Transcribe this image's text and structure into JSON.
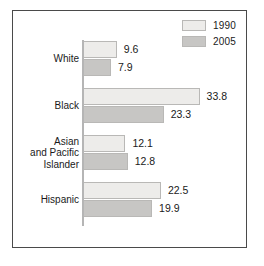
{
  "colors": {
    "bar_1990": "#edecea",
    "bar_2005": "#c7c6c4",
    "bar_border": "#b9b8b6",
    "frame": "#4a4a4a",
    "axis": "#b5b5b5",
    "text": "#1a1a1a",
    "background": "#ffffff"
  },
  "legend": {
    "items": [
      {
        "label": "1990",
        "color": "#edecea"
      },
      {
        "label": "2005",
        "color": "#c7c6c4"
      }
    ]
  },
  "chart_data": {
    "type": "bar",
    "orientation": "horizontal",
    "title": "",
    "subtitle": "",
    "xlabel": "",
    "ylabel": "",
    "grid": false,
    "legend_position": "top-right",
    "xlim": [
      0,
      35
    ],
    "categories": [
      "White",
      "Black",
      "Asian and Pacific Islander",
      "Hispanic"
    ],
    "category_lines": [
      [
        "White"
      ],
      [
        "Black"
      ],
      [
        "Asian",
        "and Pacific",
        "Islander"
      ],
      [
        "Hispanic"
      ]
    ],
    "series": [
      {
        "name": "1990",
        "color": "#edecea",
        "values": [
          9.6,
          33.8,
          12.1,
          22.5
        ]
      },
      {
        "name": "2005",
        "color": "#c7c6c4",
        "values": [
          7.9,
          23.3,
          12.8,
          19.9
        ]
      }
    ],
    "value_labels": [
      {
        "category": "White",
        "v1990": "9.6",
        "v2005": "7.9"
      },
      {
        "category": "Black",
        "v1990": "33.8",
        "v2005": "23.3"
      },
      {
        "category": "Asian and Pacific Islander",
        "v1990": "12.1",
        "v2005": "12.8"
      },
      {
        "category": "Hispanic",
        "v1990": "22.5",
        "v2005": "19.9"
      }
    ]
  }
}
